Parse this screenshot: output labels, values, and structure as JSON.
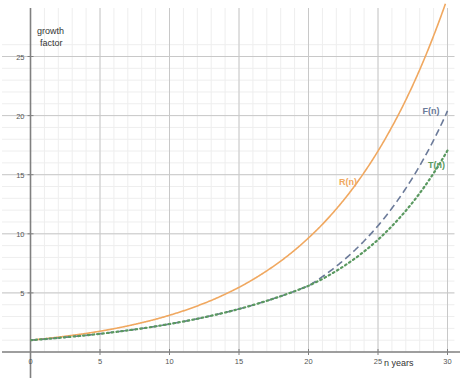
{
  "chart_data": {
    "type": "line",
    "title": "",
    "xlabel": "n years",
    "ylabel": "growth factor",
    "ylabel_line1": "growth",
    "ylabel_line2": "factor",
    "xlim": [
      0,
      30.5
    ],
    "ylim": [
      0,
      26.5
    ],
    "grid": true,
    "minor_grid": true,
    "legend_position": "inline-annotations",
    "xticks": [
      0,
      5,
      10,
      15,
      20,
      25,
      30
    ],
    "xticklabels": [
      "0",
      "5",
      "10",
      "15",
      "20",
      "25",
      "30"
    ],
    "yticks": [
      5,
      10,
      15,
      20,
      25
    ],
    "yticklabels": [
      "5",
      "10",
      "15",
      "20",
      "25"
    ],
    "x": [
      0,
      1,
      2,
      3,
      4,
      5,
      6,
      7,
      8,
      9,
      10,
      11,
      12,
      13,
      14,
      15,
      16,
      17,
      18,
      19,
      20,
      21,
      22,
      23,
      24,
      25,
      26,
      27,
      28,
      29,
      30
    ],
    "series": [
      {
        "name": "R(n)",
        "color": "#f0a860",
        "style": "solid",
        "label": "R(n)",
        "label_x": 22.2,
        "label_y": 14.1,
        "values": [
          1.0,
          1.12,
          1.26,
          1.41,
          1.57,
          1.76,
          1.97,
          2.21,
          2.48,
          2.77,
          3.11,
          3.48,
          3.9,
          4.36,
          4.89,
          5.47,
          6.13,
          6.87,
          7.69,
          8.61,
          9.65,
          10.8,
          12.1,
          13.55,
          15.18,
          17.0,
          19.04,
          21.32,
          23.88,
          26.75,
          29.96
        ]
      },
      {
        "name": "F(n)",
        "color": "#6b7a99",
        "style": "dashed",
        "label": "F(n)",
        "label_x": 28.2,
        "label_y": 20.1,
        "values": [
          1.0,
          1.09,
          1.19,
          1.3,
          1.41,
          1.54,
          1.68,
          1.83,
          1.99,
          2.17,
          2.37,
          2.58,
          2.81,
          3.07,
          3.34,
          3.64,
          3.97,
          4.33,
          4.72,
          5.14,
          5.6,
          6.37,
          7.25,
          8.25,
          9.39,
          10.68,
          12.16,
          13.84,
          15.75,
          17.92,
          20.4
        ]
      },
      {
        "name": "T(n)",
        "color": "#5a9960",
        "style": "dotted",
        "label": "T(n)",
        "label_x": 28.6,
        "label_y": 15.6,
        "values": [
          1.0,
          1.09,
          1.19,
          1.3,
          1.41,
          1.54,
          1.68,
          1.83,
          1.99,
          2.17,
          2.37,
          2.58,
          2.81,
          3.07,
          3.34,
          3.64,
          3.97,
          4.33,
          4.72,
          5.14,
          5.6,
          6.18,
          6.86,
          7.63,
          8.5,
          9.5,
          10.65,
          11.95,
          13.43,
          15.12,
          17.05
        ]
      }
    ]
  },
  "axis": {
    "x_axis_title": "n years",
    "y_axis_title_line1": "growth",
    "y_axis_title_line2": "factor"
  },
  "colors": {
    "background": "#ffffff",
    "axis": "#808080",
    "major_grid": "#c8c8c8",
    "minor_grid": "#eeeeee",
    "tick_text": "#555555",
    "orange": "#f0a860",
    "blue": "#6b7a99",
    "green": "#5a9960"
  }
}
